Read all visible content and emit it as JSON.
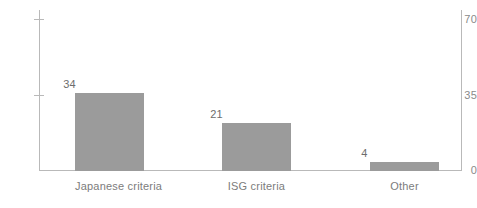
{
  "chart_data": {
    "type": "bar",
    "title": "",
    "subtitle": "",
    "xlabel": "",
    "ylabel": "",
    "categories": [
      "Japanese criteria",
      "ISG criteria",
      "Other"
    ],
    "values": [
      34,
      21,
      4
    ],
    "value_labels": [
      "34",
      "21",
      "4"
    ],
    "ylim": [
      0,
      70
    ],
    "yticks": [
      0,
      35,
      70
    ],
    "ytick_labels": [
      "0",
      "35",
      "70"
    ],
    "grid": false,
    "legend": null,
    "legend_position": "none",
    "annotations": [],
    "series": [
      {
        "name": "",
        "values": [
          34,
          21,
          4
        ]
      }
    ]
  },
  "axis": {
    "y": {
      "tick_70": "70",
      "tick_35": "35",
      "tick_0": "0"
    }
  },
  "colors": {
    "bar_fill": "#9b9b9b",
    "axis_line": "#b9b9b9",
    "tick_text": "#8a8a8a",
    "value_text": "#6d6d6d",
    "category_text": "#7c7c7c",
    "background": "#ffffff"
  }
}
